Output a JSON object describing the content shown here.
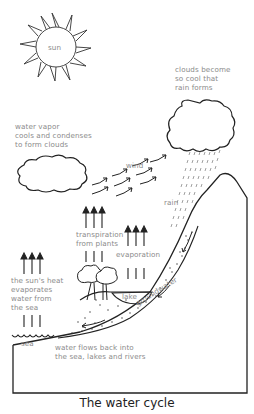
{
  "title": "The water cycle",
  "labels": {
    "sun": "sun",
    "clouds_become": "clouds become\nso cool that\nrain forms",
    "water_vapor": "water vapor\ncools and condenses\nto form clouds",
    "wind": "wind",
    "rain": "rain",
    "transpiration": "transpiration\nfrom plants",
    "evaporation": "evaporation",
    "suns_heat": "the sun's heat\nevaporates\nwater from\nthe sea",
    "lake": "lake",
    "groundwater": "groundwater",
    "sea": "sea",
    "flows_back": "water flows back into\nthe sea, lakes and rivers"
  },
  "colors": {
    "line": "#222222",
    "label": "#8a8a8a",
    "rain": "#777777"
  }
}
